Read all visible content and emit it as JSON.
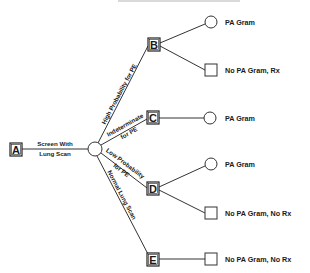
{
  "diagram": {
    "type": "decision-tree",
    "title_clipped": "",
    "root": {
      "id": "A",
      "label": "A"
    },
    "root_edge": {
      "line1": "Screen With",
      "line2": "Lung Scan"
    },
    "decision_nodes": [
      {
        "id": "B",
        "label": "B"
      },
      {
        "id": "C",
        "label": "C"
      },
      {
        "id": "D",
        "label": "D"
      },
      {
        "id": "E",
        "label": "E"
      }
    ],
    "branch_labels": {
      "B": "High Probability for PE",
      "C_line1": "Indeterminate",
      "C_line2": "for PE",
      "D_line1": "Low Probability",
      "D_line2": "for PE",
      "E": "Normal Lung Scan"
    },
    "outcomes": {
      "B_pa": "PA Gram",
      "B_no": "No PA Gram, Rx",
      "C_pa": "PA Gram",
      "D_pa": "PA Gram",
      "D_no": "No PA Gram, No Rx",
      "E_no": "No PA Gram, No Rx"
    },
    "colors": {
      "line": "#333333",
      "text": "#1a1a1a",
      "background": "#ffffff"
    }
  }
}
